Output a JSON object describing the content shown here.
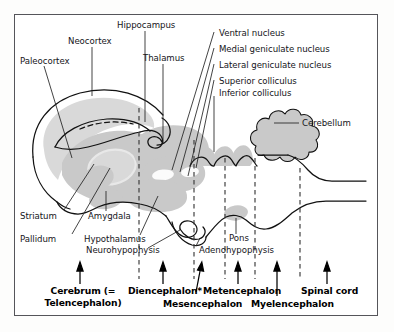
{
  "figure": {
    "type": "anatomical-diagram",
    "background_color": "#ffffff",
    "frame_color": "#55555a",
    "shade_light": "#d9d9d9",
    "shade_mid": "#c9c9c9",
    "outline_color": "#111111"
  },
  "labels": {
    "structures": [
      {
        "id": "paleocortex",
        "text": "Paleocortex",
        "x": 20,
        "y": 61
      },
      {
        "id": "neocortex",
        "text": "Neocortex",
        "x": 70,
        "y": 41
      },
      {
        "id": "hippocampus",
        "text": "Hippocampus",
        "x": 118,
        "y": 25
      },
      {
        "id": "thalamus",
        "text": "Thalamus",
        "x": 144,
        "y": 58
      },
      {
        "id": "ventral-nucleus",
        "text": "Ventral nucleus",
        "x": 218,
        "y": 34
      },
      {
        "id": "medial-geniculate-nucleus",
        "text": "Medial geniculate nucleus",
        "x": 218,
        "y": 50
      },
      {
        "id": "lateral-geniculate-nucleus",
        "text": "Lateral geniculate nucleus",
        "x": 218,
        "y": 66
      },
      {
        "id": "superior-colliculus",
        "text": "Superior colliculus",
        "x": 218,
        "y": 82
      },
      {
        "id": "inferior-colliculus",
        "text": "Inferior colliculus",
        "x": 218,
        "y": 93
      },
      {
        "id": "cerebellum",
        "text": "Cerebellum",
        "x": 302,
        "y": 126
      },
      {
        "id": "striatum",
        "text": "Striatum",
        "x": 20,
        "y": 216
      },
      {
        "id": "pallidum",
        "text": "Pallidum",
        "x": 20,
        "y": 239
      },
      {
        "id": "amygdala",
        "text": "Amygdala",
        "x": 88,
        "y": 216
      },
      {
        "id": "hypothalamus",
        "text": "Hypothalamus",
        "x": 84,
        "y": 239
      },
      {
        "id": "neurohypophysis",
        "text": "Neurohypophysis",
        "x": 86,
        "y": 250
      },
      {
        "id": "pons",
        "text": "Pons",
        "x": 230,
        "y": 238
      },
      {
        "id": "adenohypophysis",
        "text": "Adenohypophysis",
        "x": 198,
        "y": 250
      }
    ],
    "divisions": [
      {
        "id": "cerebrum",
        "line1": "Cerebrum (=",
        "line2": "Telencephalon)",
        "x": 44,
        "y": 286,
        "width": 76
      },
      {
        "id": "diencephalon",
        "line1": "Diencephalon*",
        "line2": "",
        "x": 130,
        "y": 286,
        "width": 70
      },
      {
        "id": "mesencephalon",
        "line1": "Mesencephalon",
        "line2": "",
        "x": 166,
        "y": 299,
        "width": 76
      },
      {
        "id": "metencephalon",
        "line1": "Metencephalon",
        "line2": "",
        "x": 204,
        "y": 286,
        "width": 76
      },
      {
        "id": "myelencephalon",
        "line1": "Myelencephalon",
        "line2": "",
        "x": 252,
        "y": 299,
        "width": 80
      },
      {
        "id": "spinal-cord",
        "line1": "Spinal cord",
        "line2": "",
        "x": 300,
        "y": 286,
        "width": 58
      }
    ]
  },
  "guides": {
    "dashed_x": [
      139,
      194,
      225,
      255,
      300
    ],
    "arrow_x": [
      80,
      163,
      200,
      238,
      277,
      327
    ]
  }
}
